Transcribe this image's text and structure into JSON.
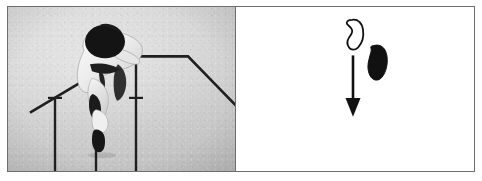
{
  "figure": {
    "panel_count": 2,
    "border_color": "#6e6e6e",
    "background_color": "#ffffff"
  },
  "left_panel": {
    "name": "photograph-panel",
    "caption": "",
    "background_color": "#cfcfcf",
    "ink_color": "#1a1a1a",
    "subject": {
      "name": "gymnast",
      "description": "Gymnast in white uniform with dark hair piled high, bent forward over the bars",
      "uniform_color": "#f2f2f2",
      "hair_color": "#141414",
      "belt_color": "#1f1f1f"
    },
    "apparatus": {
      "name": "parallel-bars",
      "description": "Angled bars with T-shaped vertical support posts",
      "bar_color": "#1f1f1f",
      "post_count": 3,
      "rails": [
        {
          "name": "left-rail",
          "slope": "descending-left"
        },
        {
          "name": "right-rail",
          "slope": "descending-right"
        }
      ]
    }
  },
  "right_panel": {
    "name": "schematic-panel",
    "background_color": "#ffffff",
    "shapes": [
      {
        "name": "outlined-blob",
        "style": "outline",
        "stroke_color": "#111111",
        "fill_color": "#ffffff",
        "description": "Open foot-shaped outline, upper position"
      },
      {
        "name": "filled-blob",
        "style": "filled",
        "fill_color": "#111111",
        "description": "Solid black foot-shaped silhouette, to the right and below the outline"
      }
    ],
    "arrow": {
      "name": "downward-arrow",
      "direction": "down",
      "color": "#111111",
      "label": ""
    }
  }
}
